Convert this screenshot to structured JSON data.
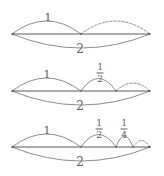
{
  "figure": {
    "background_color": "#ffffff",
    "line_color": "#6f6f6f",
    "text_color": "#5d5d5d",
    "baseline_x_start": 12,
    "baseline_x_end": 150,
    "rows": [
      {
        "id": "row-1",
        "baseline_y": 34,
        "below_label": "2",
        "below_label_x": 80,
        "below_label_y": 49,
        "upper_arcs": [
          {
            "label": "1",
            "label_x": 48,
            "label_y": 17,
            "x_start": 12,
            "x_end": 81,
            "style": "solid"
          },
          {
            "label": "",
            "label_x": 0,
            "label_y": 0,
            "x_start": 81,
            "x_end": 150,
            "style": "dashed"
          }
        ]
      },
      {
        "id": "row-2",
        "baseline_y": 91,
        "below_label": "2",
        "below_label_x": 80,
        "below_label_y": 106,
        "upper_arcs": [
          {
            "label": "1",
            "label_x": 47,
            "label_y": 74,
            "x_start": 12,
            "x_end": 81,
            "style": "solid"
          },
          {
            "label": "1/2",
            "label_x": 100,
            "label_y": 73,
            "x_start": 81,
            "x_end": 116,
            "style": "solid"
          },
          {
            "label": "",
            "label_x": 0,
            "label_y": 0,
            "x_start": 116,
            "x_end": 150,
            "style": "dashed"
          }
        ]
      },
      {
        "id": "row-3",
        "baseline_y": 147,
        "below_label": "2",
        "below_label_x": 80,
        "below_label_y": 162,
        "upper_arcs": [
          {
            "label": "1",
            "label_x": 47,
            "label_y": 130,
            "x_start": 12,
            "x_end": 81,
            "style": "solid"
          },
          {
            "label": "1/2",
            "label_x": 99,
            "label_y": 129,
            "x_start": 81,
            "x_end": 116,
            "style": "solid"
          },
          {
            "label": "1/4",
            "label_x": 124,
            "label_y": 129,
            "x_start": 116,
            "x_end": 133,
            "style": "solid"
          },
          {
            "label": "",
            "label_x": 0,
            "label_y": 0,
            "x_start": 133,
            "x_end": 150,
            "style": "dashed"
          }
        ]
      }
    ],
    "fraction_labels": {
      "half": {
        "numerator": "1",
        "denominator": "2"
      },
      "quarter": {
        "numerator": "1",
        "denominator": "4"
      }
    }
  }
}
